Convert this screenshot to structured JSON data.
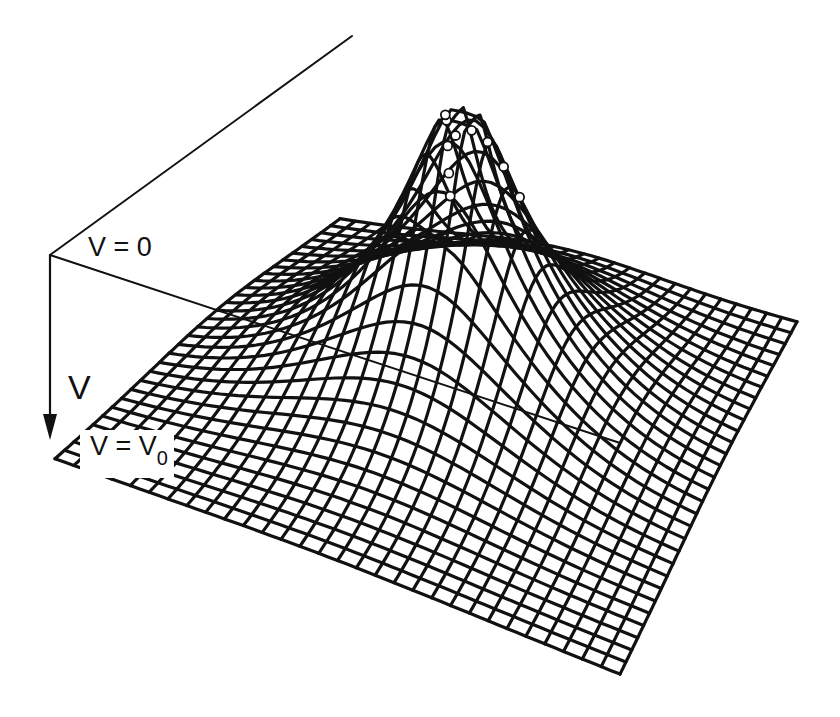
{
  "figure": {
    "type": "3d-wireframe-surface",
    "colors": {
      "line": "#111111",
      "background": "#ffffff",
      "marker_fill": "#ffffff"
    }
  },
  "labels": {
    "v_zero": "V = 0",
    "v_axis": "V",
    "v_equals": "V = V",
    "v_sub": "0"
  },
  "mesh": {
    "grid_lines": 30,
    "corners": {
      "back": [
        340,
        228
      ],
      "right": [
        797,
        330
      ],
      "front": [
        620,
        680
      ],
      "left": [
        55,
        465
      ]
    },
    "peak_height_px": 300,
    "peak_width": 0.12,
    "peak_cap": 0.93,
    "line_width": 3.2
  },
  "axes": {
    "origin": [
      50,
      255
    ],
    "upper_line_end": [
      352,
      36
    ],
    "down_arrow_end": [
      50,
      440
    ],
    "horizontal_line_end": [
      620,
      443
    ]
  },
  "markers_note": "small open circles along two grid lines near peak"
}
